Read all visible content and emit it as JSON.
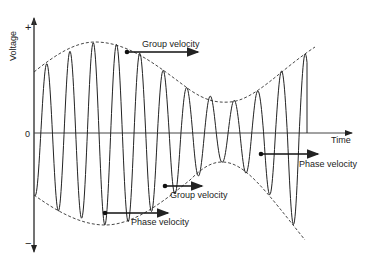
{
  "diagram": {
    "axes": {
      "y_label": "Voltage",
      "y_plus": "+",
      "y_zero": "0",
      "y_minus": "−",
      "x_label": "Time"
    },
    "annotations": [
      {
        "id": "group-velocity-top",
        "text": "Group velocity"
      },
      {
        "id": "phase-velocity-right",
        "text": "Phase velocity"
      },
      {
        "id": "group-velocity-bottom",
        "text": "Group velocity"
      },
      {
        "id": "phase-velocity-bottom",
        "text": "Phase velocity"
      }
    ],
    "colors": {
      "line": "#222222",
      "background": "#ffffff"
    }
  }
}
